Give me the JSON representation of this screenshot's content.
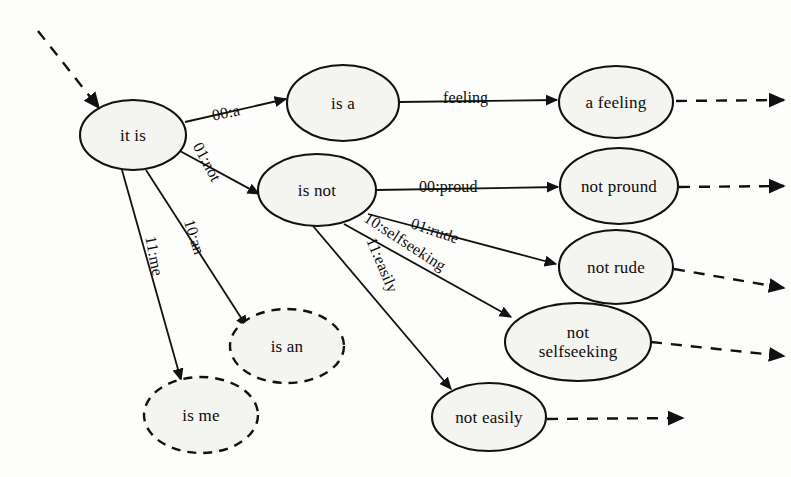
{
  "diagram": {
    "background_color": "#fdfdfb",
    "stroke_color": "#111111",
    "node_fill_color": "#f4f4f0",
    "nodes": [
      {
        "id": "it-is",
        "label": "it is",
        "cx": 133,
        "cy": 135,
        "rx": 53,
        "ry": 35,
        "style": "solid"
      },
      {
        "id": "is-a",
        "label": "is a",
        "cx": 343,
        "cy": 103,
        "rx": 56,
        "ry": 38,
        "style": "solid"
      },
      {
        "id": "is-not",
        "label": "is not",
        "cx": 317,
        "cy": 190,
        "rx": 59,
        "ry": 36,
        "style": "solid"
      },
      {
        "id": "is-an",
        "label": "is an",
        "cx": 287,
        "cy": 346,
        "rx": 57,
        "ry": 37,
        "style": "dashed"
      },
      {
        "id": "is-me",
        "label": "is me",
        "cx": 201,
        "cy": 415,
        "rx": 57,
        "ry": 38,
        "style": "dashed"
      },
      {
        "id": "a-feeling",
        "label": "a feeling",
        "cx": 616,
        "cy": 102,
        "rx": 57,
        "ry": 36,
        "style": "solid"
      },
      {
        "id": "not-pround",
        "label": "not pround",
        "cx": 619,
        "cy": 186,
        "rx": 59,
        "ry": 38,
        "style": "solid"
      },
      {
        "id": "not-rude",
        "label": "not rude",
        "cx": 616,
        "cy": 267,
        "rx": 57,
        "ry": 37,
        "style": "solid"
      },
      {
        "id": "not-selfseeking",
        "label": "not\nselfseeking",
        "cx": 578,
        "cy": 342,
        "rx": 73,
        "ry": 39,
        "style": "solid"
      },
      {
        "id": "not-easily",
        "label": "not easily",
        "cx": 489,
        "cy": 417,
        "rx": 57,
        "ry": 34,
        "style": "solid"
      }
    ],
    "edges": [
      {
        "id": "entry-to-it-is",
        "from": "",
        "to": "it-is",
        "label": "",
        "style": "dashed",
        "x1": 38,
        "y1": 31,
        "x2": 99,
        "y2": 108,
        "label_x": 0,
        "label_y": 0,
        "label_rotate": 0
      },
      {
        "id": "it-is-to-is-a",
        "from": "it is",
        "to": "is a",
        "label": "00:a",
        "style": "solid",
        "x1": 185,
        "y1": 122,
        "x2": 286,
        "y2": 99,
        "label_x": 212,
        "label_y": 104,
        "label_rotate": -12
      },
      {
        "id": "it-is-to-is-not",
        "from": "it is",
        "to": "is not",
        "label": "01:not",
        "style": "solid",
        "x1": 180,
        "y1": 151,
        "x2": 259,
        "y2": 194,
        "label_x": 186,
        "label_y": 153,
        "label_rotate": 62
      },
      {
        "id": "it-is-to-is-an",
        "from": "it is",
        "to": "is an",
        "label": "10:an",
        "style": "solid",
        "x1": 146,
        "y1": 170,
        "x2": 247,
        "y2": 327,
        "label_x": 176,
        "label_y": 228,
        "label_rotate": 72
      },
      {
        "id": "it-is-to-is-me",
        "from": "it is",
        "to": "is me",
        "label": "11:me",
        "style": "solid",
        "x1": 122,
        "y1": 170,
        "x2": 181,
        "y2": 380,
        "label_x": 134,
        "label_y": 247,
        "label_rotate": 79
      },
      {
        "id": "is-a-to-a-feeling",
        "from": "is a",
        "to": "a feeling",
        "label": "feeling",
        "style": "solid",
        "x1": 399,
        "y1": 102,
        "x2": 557,
        "y2": 100,
        "label_x": 443,
        "label_y": 89,
        "label_rotate": 0
      },
      {
        "id": "is-not-to-not-pround",
        "from": "is not",
        "to": "not pround",
        "label": "00:proud",
        "style": "solid",
        "x1": 376,
        "y1": 190,
        "x2": 558,
        "y2": 187,
        "label_x": 419,
        "label_y": 178,
        "label_rotate": 0
      },
      {
        "id": "is-not-to-not-rude",
        "from": "is not",
        "to": "not rude",
        "label": "01:rude",
        "style": "solid",
        "x1": 368,
        "y1": 214,
        "x2": 556,
        "y2": 264,
        "label_x": 410,
        "label_y": 222,
        "label_rotate": 19
      },
      {
        "id": "is-not-to-not-selfseek",
        "from": "is not",
        "to": "not selfseeking",
        "label": "10:selfseeking",
        "style": "solid",
        "x1": 344,
        "y1": 224,
        "x2": 511,
        "y2": 317,
        "label_x": 358,
        "label_y": 233,
        "label_rotate": 33
      },
      {
        "id": "is-not-to-not-easily",
        "from": "is not",
        "to": "not easily",
        "label": "11:easily",
        "style": "solid",
        "x1": 313,
        "y1": 226,
        "x2": 451,
        "y2": 389,
        "label_x": 353,
        "label_y": 256,
        "label_rotate": 67
      },
      {
        "id": "a-feeling-exit",
        "from": "a feeling",
        "to": "",
        "label": "",
        "style": "dashed",
        "x1": 676,
        "y1": 101,
        "x2": 784,
        "y2": 100,
        "label_x": 0,
        "label_y": 0,
        "label_rotate": 0
      },
      {
        "id": "not-pround-exit",
        "from": "not pround",
        "to": "",
        "label": "",
        "style": "dashed",
        "x1": 679,
        "y1": 187,
        "x2": 784,
        "y2": 186,
        "label_x": 0,
        "label_y": 0,
        "label_rotate": 0
      },
      {
        "id": "not-rude-exit",
        "from": "not rude",
        "to": "",
        "label": "",
        "style": "dashed",
        "x1": 674,
        "y1": 269,
        "x2": 784,
        "y2": 288,
        "label_x": 0,
        "label_y": 0,
        "label_rotate": 0
      },
      {
        "id": "not-selfseeking-exit",
        "from": "not selfseeking",
        "to": "",
        "label": "",
        "style": "dashed",
        "x1": 651,
        "y1": 342,
        "x2": 784,
        "y2": 356,
        "label_x": 0,
        "label_y": 0,
        "label_rotate": 0
      },
      {
        "id": "not-easily-exit",
        "from": "not easily",
        "to": "",
        "label": "",
        "style": "dashed",
        "x1": 547,
        "y1": 419,
        "x2": 683,
        "y2": 418,
        "label_x": 0,
        "label_y": 0,
        "label_rotate": 0
      }
    ]
  }
}
